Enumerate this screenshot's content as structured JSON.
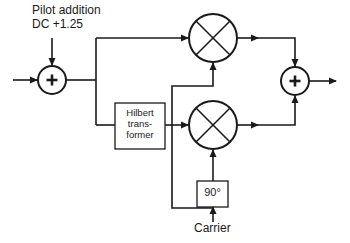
{
  "diagram": {
    "type": "block-diagram",
    "labels": {
      "pilot_line1": "Pilot addition",
      "pilot_line2": "DC +1.25",
      "hilbert_line1": "Hilbert",
      "hilbert_line2": "trans-",
      "hilbert_line3": "former",
      "phase_shift": "90°",
      "carrier": "Carrier"
    },
    "nodes": [
      {
        "id": "input_adder",
        "kind": "summer",
        "symbol": "+"
      },
      {
        "id": "mixer_top",
        "kind": "multiplier",
        "symbol": "×"
      },
      {
        "id": "hilbert",
        "kind": "block",
        "label": "Hilbert transformer"
      },
      {
        "id": "mixer_bottom",
        "kind": "multiplier",
        "symbol": "×"
      },
      {
        "id": "phase_90",
        "kind": "block",
        "label": "90°"
      },
      {
        "id": "output_adder",
        "kind": "summer",
        "symbol": "+"
      }
    ],
    "edges": [
      [
        "input",
        "input_adder"
      ],
      [
        "pilot_addition",
        "input_adder"
      ],
      [
        "input_adder",
        "mixer_top"
      ],
      [
        "input_adder",
        "hilbert"
      ],
      [
        "hilbert",
        "mixer_bottom"
      ],
      [
        "carrier",
        "mixer_top"
      ],
      [
        "carrier",
        "phase_90"
      ],
      [
        "phase_90",
        "mixer_bottom"
      ],
      [
        "mixer_top",
        "output_adder"
      ],
      [
        "mixer_bottom",
        "output_adder"
      ],
      [
        "output_adder",
        "output"
      ]
    ],
    "colors": {
      "stroke": "#1a1a1a",
      "background": "#ffffff"
    }
  }
}
